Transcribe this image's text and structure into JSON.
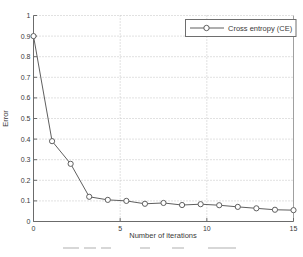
{
  "chart_data": {
    "type": "line",
    "title": "",
    "xlabel": "Number of iterations",
    "ylabel": "Error",
    "xlim": [
      0,
      15
    ],
    "ylim": [
      0,
      1
    ],
    "x_ticks": [
      0,
      5,
      10,
      15
    ],
    "x_tick_labels": [
      "0",
      "5",
      "10",
      "15"
    ],
    "y_ticks": [
      0,
      0.1,
      0.2,
      0.3,
      0.4,
      0.5,
      0.6,
      0.7,
      0.8,
      0.9,
      1
    ],
    "y_tick_labels": [
      "0",
      "0.1",
      "0.2",
      "0.3",
      "0.4",
      "0.5",
      "0.6",
      "0.7",
      "0.8",
      "0.9",
      "1"
    ],
    "grid": true,
    "grid_style": "dotted",
    "legend_position": "top-right",
    "series": [
      {
        "name": "Cross entropy (CE)",
        "marker": "circle",
        "marker_fill": "open",
        "color": "#5f5f5f",
        "x": [
          0,
          1.071,
          2.143,
          3.214,
          4.286,
          5.357,
          6.429,
          7.5,
          8.571,
          9.643,
          10.714,
          11.786,
          12.857,
          13.929,
          15
        ],
        "y": [
          0.9,
          0.39,
          0.28,
          0.12,
          0.105,
          0.1,
          0.086,
          0.09,
          0.08,
          0.084,
          0.079,
          0.071,
          0.064,
          0.057,
          0.055
        ]
      }
    ]
  },
  "colors": {
    "background": "#ffffff",
    "line": "#5f5f5f",
    "grid": "#c2c2c2",
    "axis": "#6b6b6b",
    "border": "#a0a0a0",
    "text": "#3a3a3a",
    "legend_border": "#6e6e6e"
  }
}
